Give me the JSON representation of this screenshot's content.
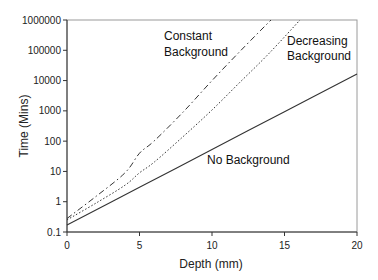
{
  "chart_data": {
    "type": "line",
    "title": "",
    "xlabel": "Depth (mm)",
    "ylabel": "Time (Mins)",
    "xlim": [
      0,
      20
    ],
    "ylim": [
      0.1,
      1000000
    ],
    "yscale": "log",
    "grid": false,
    "legend": "none (inline annotations)",
    "x_ticks": [
      "0",
      "5",
      "10",
      "15",
      "20"
    ],
    "y_ticks": [
      "0.1",
      "1",
      "10",
      "100",
      "1000",
      "10000",
      "100000",
      "1000000"
    ],
    "series": [
      {
        "name": "Constant Background",
        "style": "dash-dot",
        "x": [
          0,
          2,
          4,
          5,
          6,
          8,
          10,
          12,
          14.07
        ],
        "values": [
          0.28,
          1.5,
          9,
          40,
          100,
          900,
          10000,
          100000,
          1000000
        ]
      },
      {
        "name": "Decreasing Background",
        "style": "dotted",
        "x": [
          0,
          2,
          4,
          5,
          6,
          8,
          10,
          12,
          14,
          16.07
        ],
        "values": [
          0.25,
          0.9,
          3.5,
          9,
          20,
          140,
          1070,
          9500,
          85000,
          1000000
        ]
      },
      {
        "name": "No Background",
        "style": "solid",
        "x": [
          0,
          5,
          10,
          15,
          20
        ],
        "values": [
          0.17,
          3.0,
          53,
          940,
          16600
        ]
      }
    ],
    "annotations": [
      {
        "text": "Constant",
        "text2": "Background",
        "near_series": "Constant Background"
      },
      {
        "text": "Decreasing",
        "text2": "Background",
        "near_series": "Decreasing Background"
      },
      {
        "text": "No Background",
        "near_series": "No Background"
      }
    ]
  },
  "labels": {
    "xlabel": "Depth (mm)",
    "ylabel": "Time (Mins)",
    "constant_1": "Constant",
    "constant_2": "Background",
    "decreasing_1": "Decreasing",
    "decreasing_2": "Background",
    "none": "No Background"
  }
}
